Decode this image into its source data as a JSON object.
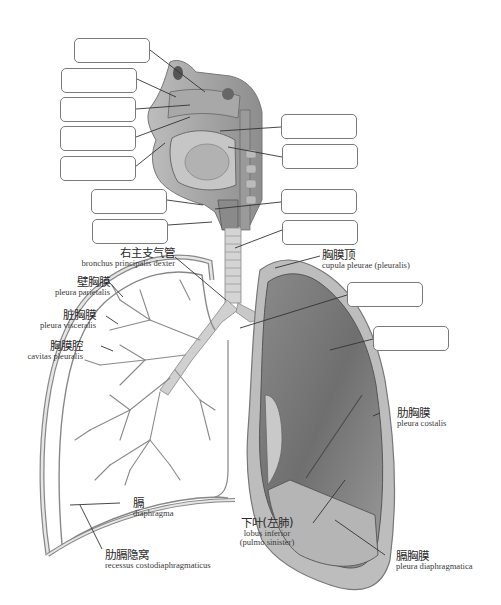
{
  "diagram": {
    "blank_boxes": [
      {
        "id": "box-1",
        "x": 74,
        "y": 38,
        "value": ""
      },
      {
        "id": "box-2",
        "x": 61,
        "y": 68,
        "value": ""
      },
      {
        "id": "box-3",
        "x": 60,
        "y": 97,
        "value": ""
      },
      {
        "id": "box-4",
        "x": 60,
        "y": 126,
        "value": ""
      },
      {
        "id": "box-5",
        "x": 60,
        "y": 156,
        "value": ""
      },
      {
        "id": "box-6",
        "x": 91,
        "y": 189,
        "value": ""
      },
      {
        "id": "box-7",
        "x": 92,
        "y": 219,
        "value": ""
      },
      {
        "id": "box-r1",
        "x": 281,
        "y": 114,
        "value": ""
      },
      {
        "id": "box-r2",
        "x": 282,
        "y": 144,
        "value": ""
      },
      {
        "id": "box-r3",
        "x": 281,
        "y": 189,
        "value": ""
      },
      {
        "id": "box-r4",
        "x": 282,
        "y": 220,
        "value": ""
      },
      {
        "id": "box-r5",
        "x": 347,
        "y": 282,
        "value": ""
      },
      {
        "id": "box-r6",
        "x": 373,
        "y": 326,
        "value": ""
      }
    ],
    "labels": {
      "bronchus": {
        "zh": "右主支气管",
        "la": "bronchus principalis dexter"
      },
      "pleura_parietalis": {
        "zh": "壁胸膜",
        "la": "pleura parietalis"
      },
      "pleura_visceralis": {
        "zh": "脏胸膜",
        "la": "pleura visceralis"
      },
      "cavitas": {
        "zh": "胸膜腔",
        "la": "cavitas pleuralis"
      },
      "cupula": {
        "zh": "胸膜顶",
        "la": "cupula pleurae (pleuralis)"
      },
      "costalis": {
        "zh": "肋胸膜",
        "la": "pleura costalis"
      },
      "diaphragma": {
        "zh": "膈",
        "la": "diaphragma"
      },
      "recessus": {
        "zh": "肋膈隐窝",
        "la": "recessus costodiaphragmaticus"
      },
      "lobus": {
        "zh": "下叶(左肺)",
        "la1": "lobus inferior",
        "la2": "(pulmo sinister)"
      },
      "diaphragmatica": {
        "zh": "膈胸膜",
        "la": "pleura diaphragmatica"
      }
    }
  }
}
